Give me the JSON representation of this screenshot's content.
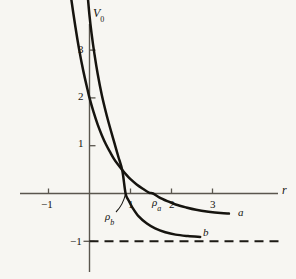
{
  "figure": {
    "background_color": "#f7f6f2",
    "ink_color": "#16140f",
    "axis_color": "#5a564e"
  },
  "axes": {
    "y_label_main": "V",
    "y_label_sub": "0",
    "x_label": "r",
    "x_ticks": [
      {
        "value": -1,
        "label": "−1"
      },
      {
        "value": 1,
        "label": "1"
      },
      {
        "value": 2,
        "label": "2"
      },
      {
        "value": 3,
        "label": "3"
      }
    ],
    "y_ticks": [
      {
        "value": 1,
        "label": "1"
      },
      {
        "value": 2,
        "label": "2"
      },
      {
        "value": 3,
        "label": "3"
      },
      {
        "value": -1,
        "label": "−1"
      }
    ]
  },
  "annotations": {
    "rho_a_main": "ρ",
    "rho_a_sub": "a",
    "rho_b_main": "ρ",
    "rho_b_sub": "b",
    "curve_a_label": "a",
    "curve_b_label": "b"
  },
  "chart_data": {
    "type": "line",
    "title": "",
    "xlabel": "r",
    "ylabel": "V_0",
    "xlim": [
      -1.5,
      3.6
    ],
    "ylim": [
      -1.35,
      3.9
    ],
    "grid": false,
    "legend": "inline-curve-labels",
    "asymptote": {
      "label": "−1",
      "y": -1,
      "style": "dashed",
      "x_from": 0,
      "x_to": 4.75
    },
    "series": [
      {
        "name": "a",
        "label_at": {
          "x": 3.55,
          "y": -0.4
        },
        "zero_crossing": 1.55,
        "zero_crossing_marker": "ρ_a",
        "points": [
          [
            -0.52,
            4.55
          ],
          [
            -0.45,
            4.1
          ],
          [
            -0.35,
            3.52
          ],
          [
            -0.25,
            3.0
          ],
          [
            -0.15,
            2.56
          ],
          [
            -0.05,
            2.18
          ],
          [
            0.0,
            2.0
          ],
          [
            0.1,
            1.7
          ],
          [
            0.2,
            1.44
          ],
          [
            0.3,
            1.22
          ],
          [
            0.4,
            1.03
          ],
          [
            0.5,
            0.87
          ],
          [
            0.6,
            0.72
          ],
          [
            0.7,
            0.6
          ],
          [
            0.8,
            0.49
          ],
          [
            0.9,
            0.39
          ],
          [
            1.0,
            0.3
          ],
          [
            1.15,
            0.19
          ],
          [
            1.3,
            0.1
          ],
          [
            1.45,
            0.02
          ],
          [
            1.55,
            0.0
          ],
          [
            1.7,
            -0.08
          ],
          [
            1.9,
            -0.16
          ],
          [
            2.1,
            -0.23
          ],
          [
            2.35,
            -0.29
          ],
          [
            2.6,
            -0.34
          ],
          [
            2.9,
            -0.38
          ],
          [
            3.2,
            -0.41
          ],
          [
            3.4,
            -0.42
          ]
        ]
      },
      {
        "name": "b",
        "label_at": {
          "x": 2.92,
          "y": -0.82
        },
        "zero_crossing": 0.88,
        "zero_crossing_marker": "ρ_b",
        "points": [
          [
            -0.1,
            4.7
          ],
          [
            -0.05,
            4.2
          ],
          [
            0.0,
            3.72
          ],
          [
            0.05,
            3.35
          ],
          [
            0.12,
            2.92
          ],
          [
            0.2,
            2.5
          ],
          [
            0.3,
            2.06
          ],
          [
            0.4,
            1.7
          ],
          [
            0.5,
            1.38
          ],
          [
            0.6,
            1.08
          ],
          [
            0.7,
            0.78
          ],
          [
            0.8,
            0.48
          ],
          [
            0.88,
            0.0
          ],
          [
            0.95,
            -0.14
          ],
          [
            1.05,
            -0.3
          ],
          [
            1.2,
            -0.48
          ],
          [
            1.4,
            -0.63
          ],
          [
            1.6,
            -0.73
          ],
          [
            1.85,
            -0.81
          ],
          [
            2.1,
            -0.86
          ],
          [
            2.4,
            -0.89
          ],
          [
            2.7,
            -0.91
          ]
        ]
      }
    ]
  }
}
